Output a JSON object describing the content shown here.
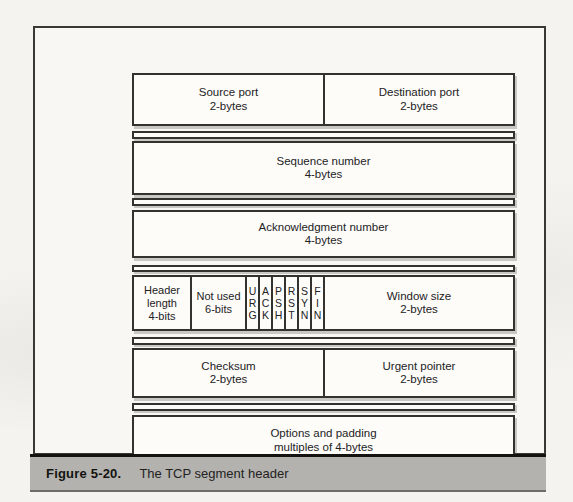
{
  "caption": {
    "label": "Figure 5-20.",
    "title": "The TCP segment header"
  },
  "header_diagram": {
    "row_ports": {
      "source": {
        "title": "Source port",
        "size": "2-bytes"
      },
      "destination": {
        "title": "Destination port",
        "size": "2-bytes"
      }
    },
    "row_sequence": {
      "title": "Sequence number",
      "size": "4-bytes"
    },
    "row_ack": {
      "title": "Acknowledgment number",
      "size": "4-bytes"
    },
    "row_flags": {
      "header_length": {
        "line1": "Header",
        "line2": "length",
        "size": "4-bits"
      },
      "not_used": {
        "title": "Not used",
        "size": "6-bits"
      },
      "flags": [
        {
          "name": "URG",
          "letters": [
            "U",
            "R",
            "G"
          ]
        },
        {
          "name": "ACK",
          "letters": [
            "A",
            "C",
            "K"
          ]
        },
        {
          "name": "PSH",
          "letters": [
            "P",
            "S",
            "H"
          ]
        },
        {
          "name": "RST",
          "letters": [
            "R",
            "S",
            "T"
          ]
        },
        {
          "name": "SYN",
          "letters": [
            "S",
            "Y",
            "N"
          ]
        },
        {
          "name": "FIN",
          "letters": [
            "F",
            "I",
            "N"
          ]
        }
      ],
      "window_size": {
        "title": "Window size",
        "size": "2-bytes"
      }
    },
    "row_checksum": {
      "checksum": {
        "title": "Checksum",
        "size": "2-bytes"
      },
      "urgent_pointer": {
        "title": "Urgent pointer",
        "size": "2-bytes"
      }
    },
    "row_options": {
      "title": "Options and padding",
      "size": "multiples of 4-bytes"
    }
  },
  "colors": {
    "paper": "#f4f3ef",
    "line": "#34322e",
    "cell_fill": "#fdfcf9",
    "caption_bar": "#b3b2af"
  }
}
